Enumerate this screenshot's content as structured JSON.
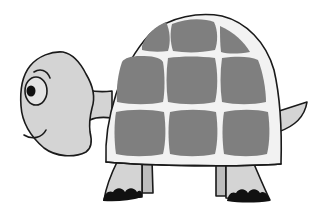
{
  "image": {
    "subject": "cartoon turtle",
    "description": "Grayscale clipart of a smiling cartoon turtle facing left, with a domed shell of rounded gray plates, four stubby legs with black toes, and a small pointed tail.",
    "colors": {
      "background": "#ffffff",
      "skin": "#d4d4d4",
      "shell_base": "#f0f0f0",
      "shell_plates": "#7f7f7f",
      "outline": "#1a1a1a",
      "toes": "#111111",
      "leg_shade": "#bdbdbd"
    },
    "parts": [
      "head",
      "eye",
      "smile",
      "neck",
      "shell",
      "shell-plates",
      "front-legs",
      "back-legs",
      "toes",
      "tail"
    ],
    "shell_plate_count": 8
  }
}
